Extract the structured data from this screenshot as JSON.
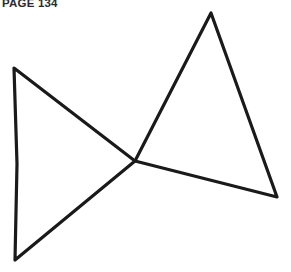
{
  "header": {
    "page_label": "PAGE 134"
  },
  "figure": {
    "name": "two-triangles-meeting-at-a-point",
    "background_color": "#ffffff",
    "stroke_color": "#1a1a1a",
    "stroke_width": 3.2,
    "canvas": {
      "width": 291,
      "height": 272
    },
    "shared_vertex": {
      "x": 135,
      "y": 161
    },
    "shapes": [
      {
        "name": "left-triangle",
        "vertices": [
          {
            "x": 14,
            "y": 68
          },
          {
            "x": 135,
            "y": 161
          },
          {
            "x": 15,
            "y": 260
          }
        ],
        "path": "M 14 68 L 135 161 L 15 260 L 17 164 Z",
        "closed": true
      },
      {
        "name": "right-triangle",
        "vertices": [
          {
            "x": 135,
            "y": 161
          },
          {
            "x": 211,
            "y": 13
          },
          {
            "x": 277,
            "y": 197
          }
        ],
        "path": "M 135 161 L 211 13 L 277 197 Z",
        "closed": true
      }
    ]
  }
}
